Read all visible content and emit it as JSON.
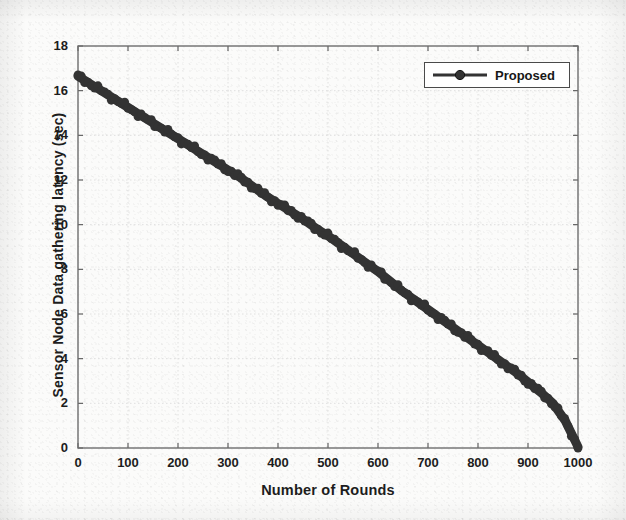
{
  "chart_data": {
    "type": "line",
    "title": "",
    "xlabel": "Number of Rounds",
    "ylabel": "Sensor Node Data gathering latency (sec)",
    "xlim": [
      0,
      1000
    ],
    "ylim": [
      0,
      18
    ],
    "xticks": [
      0,
      100,
      200,
      300,
      400,
      500,
      600,
      700,
      800,
      900,
      1000
    ],
    "yticks": [
      0,
      2,
      4,
      6,
      8,
      10,
      12,
      14,
      16,
      18
    ],
    "xtick_labels": [
      "0",
      "100",
      "200",
      "300",
      "400",
      "500",
      "600",
      "700",
      "800",
      "900",
      "1000"
    ],
    "ytick_labels": [
      "0",
      "2",
      "4",
      "6",
      "8",
      "10",
      "12",
      "14",
      "16",
      "18"
    ],
    "grid": true,
    "legend_position": "top-right",
    "series": [
      {
        "name": "Proposed",
        "color": "#333333",
        "marker": "circle",
        "linewidth": 9,
        "x": [
          0,
          25,
          50,
          75,
          100,
          125,
          150,
          175,
          200,
          225,
          250,
          275,
          300,
          325,
          350,
          375,
          400,
          425,
          450,
          475,
          500,
          525,
          550,
          575,
          600,
          625,
          650,
          675,
          700,
          725,
          750,
          775,
          800,
          825,
          850,
          875,
          900,
          925,
          950,
          975,
          1000
        ],
        "values": [
          16.65,
          16.3,
          15.95,
          15.6,
          15.25,
          14.9,
          14.55,
          14.2,
          13.85,
          13.5,
          13.15,
          12.8,
          12.45,
          12.1,
          11.7,
          11.3,
          10.95,
          10.6,
          10.25,
          9.85,
          9.5,
          9.1,
          8.7,
          8.3,
          7.9,
          7.45,
          7.0,
          6.6,
          6.2,
          5.8,
          5.4,
          5.0,
          4.6,
          4.2,
          3.8,
          3.4,
          2.95,
          2.5,
          2.0,
          1.2,
          0.05
        ]
      }
    ],
    "legend_entries": [
      {
        "label": "Proposed",
        "color": "#333333",
        "marker": "circle"
      }
    ]
  },
  "axes": {
    "plot_left_px": 78,
    "plot_top_px": 46,
    "plot_right_px": 578,
    "plot_bottom_px": 448,
    "box_color": "#6d6d6d",
    "grid_color": "#dcdcdc"
  },
  "legend": {
    "label": "Proposed"
  }
}
